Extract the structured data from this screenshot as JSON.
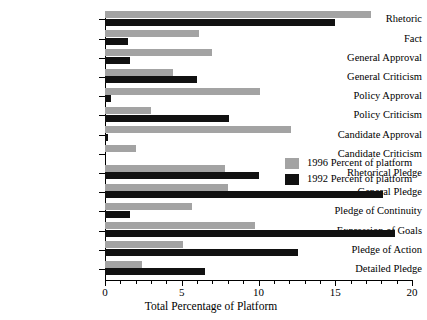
{
  "chart_data": {
    "type": "bar",
    "orientation": "horizontal",
    "title": "",
    "xlabel": "Total Percentage of Platform",
    "ylabel": "",
    "xlim": [
      0,
      20
    ],
    "xticks": [
      0,
      5,
      10,
      15,
      20
    ],
    "xtick_labels": [
      "0",
      "5",
      "10",
      "15",
      "20"
    ],
    "minor_tick_step": 1,
    "grid": false,
    "legend_position": "right-middle",
    "categories": [
      "Rhetoric",
      "Fact",
      "General Approval",
      "General Criticism",
      "Policy Approval",
      "Policy Criticism",
      "Candidate Approval",
      "Candidate Criticism",
      "Rhetorical Pledge",
      "General Pledge",
      "Pledge of Continuity",
      "Expression of Goals",
      "Pledge of Action",
      "Detailed Pledge"
    ],
    "series": [
      {
        "name": "1996 Percent of platform",
        "color": "#a3a3a3",
        "values": [
          17.3,
          6.1,
          7.0,
          4.4,
          10.1,
          3.0,
          12.1,
          2.0,
          7.8,
          8.0,
          5.7,
          9.8,
          5.1,
          2.4
        ]
      },
      {
        "name": "1992 Percent of platform",
        "color": "#111111",
        "values": [
          15.0,
          1.5,
          1.6,
          6.0,
          0.4,
          8.1,
          0.2,
          0.0,
          10.0,
          18.1,
          1.6,
          18.9,
          12.6,
          6.5
        ]
      }
    ]
  },
  "legend": {
    "items": [
      {
        "label": "1996 Percent of platform",
        "swatch": "#a3a3a3"
      },
      {
        "label": "1992 Percent of platform",
        "swatch": "#111111"
      }
    ]
  }
}
